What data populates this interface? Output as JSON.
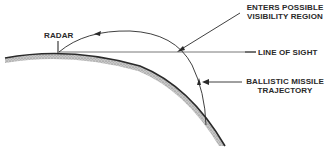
{
  "diagram": {
    "labels": {
      "radar": "RADAR",
      "visibility_line1": "ENTERS POSSIBLE",
      "visibility_line2": "VISIBILITY REGION",
      "line_of_sight": "LINE OF SIGHT",
      "trajectory_line1": "BALLISTIC MISSILE",
      "trajectory_line2": "TRAJECTORY"
    },
    "colors": {
      "ink": "#2a2a2a",
      "earth_fill": "#9a9a9a",
      "background": "#ffffff"
    }
  }
}
